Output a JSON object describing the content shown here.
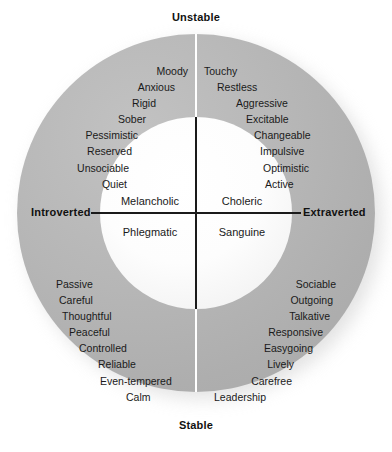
{
  "chart_data": {
    "type": "scatter",
    "xlabel": "Introverted – Extraverted",
    "ylabel": "Stable – Unstable",
    "legend_position": "none",
    "grid": false,
    "axes": {
      "top": "Unstable",
      "bottom": "Stable",
      "left": "Introverted",
      "right": "Extraverted"
    },
    "quadrants": [
      {
        "name": "Melancholic",
        "position": "upper-left",
        "axis_combination": "Introverted + Unstable",
        "traits": [
          "Moody",
          "Anxious",
          "Rigid",
          "Sober",
          "Pessimistic",
          "Reserved",
          "Unsociable",
          "Quiet"
        ]
      },
      {
        "name": "Choleric",
        "position": "upper-right",
        "axis_combination": "Extraverted + Unstable",
        "traits": [
          "Touchy",
          "Restless",
          "Aggressive",
          "Excitable",
          "Changeable",
          "Impulsive",
          "Optimistic",
          "Active"
        ]
      },
      {
        "name": "Phlegmatic",
        "position": "lower-left",
        "axis_combination": "Introverted + Stable",
        "traits": [
          "Passive",
          "Careful",
          "Thoughtful",
          "Peaceful",
          "Controlled",
          "Reliable",
          "Even-tempered",
          "Calm"
        ]
      },
      {
        "name": "Sanguine",
        "position": "lower-right",
        "axis_combination": "Extraverted + Stable",
        "traits": [
          "Sociable",
          "Outgoing",
          "Talkative",
          "Responsive",
          "Easygoing",
          "Lively",
          "Carefree",
          "Leadership"
        ]
      }
    ],
    "colors": {
      "outer_ring": "#b4b4b4",
      "inner_circle": "#fafafa",
      "text": "#1a1a1a",
      "divider": "#1a1a1a",
      "ring_divider": "#ffffff",
      "background": "#ffffff"
    }
  },
  "axes": {
    "top": "Unstable",
    "bottom": "Stable",
    "left": "Introverted",
    "right": "Extraverted"
  },
  "temperaments": {
    "upper_left": "Melancholic",
    "upper_right": "Choleric",
    "lower_left": "Phlegmatic",
    "lower_right": "Sanguine"
  },
  "traits": {
    "upper_left": [
      "Moody",
      "Anxious",
      "Rigid",
      "Sober",
      "Pessimistic",
      "Reserved",
      "Unsociable",
      "Quiet"
    ],
    "upper_right": [
      "Touchy",
      "Restless",
      "Aggressive",
      "Excitable",
      "Changeable",
      "Impulsive",
      "Optimistic",
      "Active"
    ],
    "lower_left": [
      "Passive",
      "Careful",
      "Thoughtful",
      "Peaceful",
      "Controlled",
      "Reliable",
      "Even-tempered",
      "Calm"
    ],
    "lower_right": [
      "Sociable",
      "Outgoing",
      "Talkative",
      "Responsive",
      "Easygoing",
      "Lively",
      "Carefree",
      "Leadership"
    ]
  }
}
